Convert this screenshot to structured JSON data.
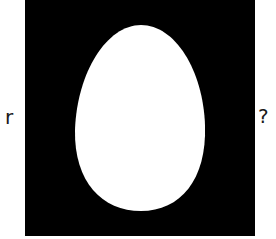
{
  "labels": {
    "left": "r",
    "right": "?"
  },
  "figure": {
    "shape": "egg",
    "background_color": "#000000",
    "shape_color": "#ffffff",
    "icon": "egg-icon"
  }
}
